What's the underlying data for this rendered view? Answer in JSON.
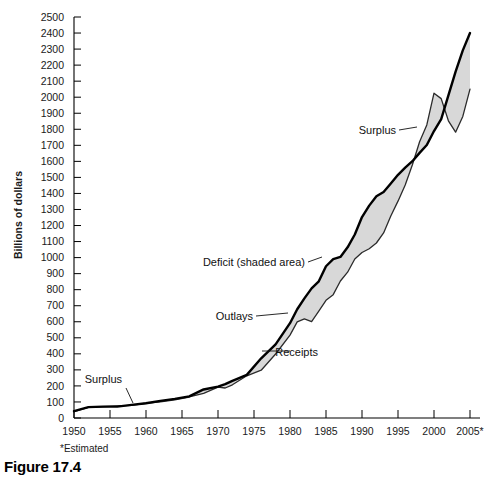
{
  "figure": {
    "caption": "Figure 17.4",
    "footnote": "*Estimated"
  },
  "chart_data": {
    "type": "area",
    "title": "",
    "xlabel": "",
    "ylabel": "Billions of dollars",
    "xlim": [
      1950,
      2005
    ],
    "ylim": [
      0,
      2500
    ],
    "grid": false,
    "legend_position": "inline-annotations",
    "x_tick_labels": [
      "1950",
      "1955",
      "1960",
      "1965",
      "1970",
      "1975",
      "1980",
      "1985",
      "1990",
      "1995",
      "2000",
      "2005*"
    ],
    "x_ticks": [
      1950,
      1955,
      1960,
      1965,
      1970,
      1975,
      1980,
      1985,
      1990,
      1995,
      2000,
      2005
    ],
    "y_ticks": [
      0,
      100,
      200,
      300,
      400,
      500,
      600,
      700,
      800,
      900,
      1000,
      1100,
      1200,
      1300,
      1400,
      1500,
      1600,
      1700,
      1800,
      1900,
      2000,
      2100,
      2200,
      2300,
      2400,
      2500
    ],
    "y_tick_labels": [
      "0",
      "100",
      "200",
      "300",
      "400",
      "500",
      "600",
      "700",
      "800",
      "900",
      "1000",
      "1100",
      "1200",
      "1300",
      "1400",
      "1500",
      "1600",
      "1700",
      "1800",
      "1900",
      "2000",
      "2100",
      "2200",
      "2300",
      "2400",
      "2500"
    ],
    "x": [
      1950,
      1952,
      1954,
      1956,
      1958,
      1960,
      1962,
      1964,
      1966,
      1968,
      1970,
      1971,
      1972,
      1974,
      1976,
      1978,
      1980,
      1981,
      1982,
      1983,
      1984,
      1985,
      1986,
      1987,
      1988,
      1989,
      1990,
      1991,
      1992,
      1993,
      1994,
      1995,
      1996,
      1997,
      1998,
      1999,
      2000,
      2001,
      2002,
      2003,
      2004,
      2005
    ],
    "series": [
      {
        "name": "Outlays",
        "color": "#000000",
        "values": [
          43,
          68,
          71,
          71,
          82,
          92,
          107,
          119,
          135,
          178,
          196,
          211,
          232,
          269,
          372,
          459,
          591,
          678,
          746,
          808,
          852,
          946,
          990,
          1004,
          1064,
          1144,
          1253,
          1324,
          1382,
          1409,
          1462,
          1516,
          1561,
          1601,
          1653,
          1702,
          1789,
          1863,
          2011,
          2160,
          2292,
          2400
        ]
      },
      {
        "name": "Receipts",
        "color": "#000000",
        "values": [
          39,
          66,
          70,
          75,
          79,
          92,
          100,
          113,
          131,
          153,
          193,
          187,
          207,
          263,
          298,
          399,
          517,
          599,
          618,
          601,
          666,
          734,
          769,
          854,
          909,
          991,
          1032,
          1055,
          1091,
          1154,
          1259,
          1352,
          1453,
          1579,
          1722,
          1827,
          2025,
          1991,
          1853,
          1782,
          1880,
          2050
        ]
      }
    ],
    "annotations": [
      {
        "id": "surplus-early",
        "text": "Surplus",
        "label_x": 122,
        "label_y": 383,
        "leader": "M126,388 L133,403"
      },
      {
        "id": "deficit",
        "text": "Deficit (shaded area)",
        "label_x": 305,
        "label_y": 266,
        "leader": "M308,262 L322,257"
      },
      {
        "id": "outlays",
        "text": "Outlays",
        "label_x": 253,
        "label_y": 320,
        "leader": "M256,316 L288,313"
      },
      {
        "id": "receipts",
        "text": "Receipts",
        "label_x": 318,
        "label_y": 356,
        "leader": "M262,351 L290,351"
      },
      {
        "id": "surplus-late",
        "text": "Surplus",
        "label_x": 396,
        "label_y": 134,
        "leader": "M399,130 L417,127"
      }
    ]
  }
}
